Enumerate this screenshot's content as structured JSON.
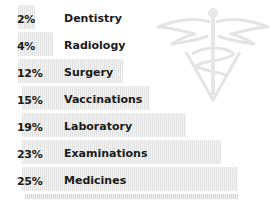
{
  "chart_data": {
    "type": "bar",
    "orientation": "horizontal",
    "title": "",
    "categories": [
      "Dentistry",
      "Radiology",
      "Surgery",
      "Vaccinations",
      "Laboratory",
      "Examinations",
      "Medicines"
    ],
    "values": [
      2,
      4,
      12,
      15,
      19,
      23,
      25
    ],
    "value_labels": [
      "2%",
      "4%",
      "12%",
      "15%",
      "19%",
      "23%",
      "25%"
    ],
    "unit": "%",
    "xlabel": "",
    "ylabel": "",
    "grid": false,
    "legend": null,
    "annotations": [
      "veterinary caduceus emblem (decorative watermark)"
    ]
  },
  "rows": [
    {
      "pct": "2%",
      "label": "Dentistry",
      "top": 13,
      "bar_left": 18,
      "bar_right": 35
    },
    {
      "pct": "4%",
      "label": "Radiology",
      "top": 40,
      "bar_left": 18,
      "bar_right": 53
    },
    {
      "pct": "12%",
      "label": "Surgery",
      "top": 67,
      "bar_left": 18,
      "bar_right": 123
    },
    {
      "pct": "15%",
      "label": "Vaccinations",
      "top": 94,
      "bar_left": 22,
      "bar_right": 150
    },
    {
      "pct": "19%",
      "label": "Laboratory",
      "top": 121,
      "bar_left": 22,
      "bar_right": 186
    },
    {
      "pct": "23%",
      "label": "Examinations",
      "top": 148,
      "bar_left": 22,
      "bar_right": 221
    },
    {
      "pct": "25%",
      "label": "Medicines",
      "top": 175,
      "bar_left": 22,
      "bar_right": 238
    }
  ],
  "colors": {
    "text": "#1a1a1a",
    "bar_stripe_dark": "#e2e2e2",
    "bar_stripe_light": "#f3f3f3",
    "emblem": "#e6e6e6"
  }
}
